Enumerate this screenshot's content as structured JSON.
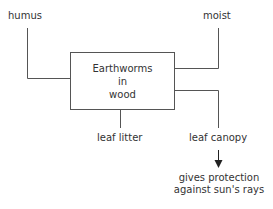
{
  "diagram": {
    "center": {
      "lines": [
        "Earthworms",
        "in",
        "wood"
      ]
    },
    "factors": {
      "humus": "humus",
      "moist": "moist",
      "leaf_litter": "leaf litter",
      "leaf_canopy": "leaf canopy"
    },
    "result": {
      "line1": "gives protection",
      "line2": "against sun's rays"
    }
  }
}
